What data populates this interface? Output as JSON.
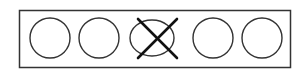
{
  "diagram": {
    "frame": {
      "x": 19,
      "y": 10,
      "width": 272,
      "height": 58,
      "stroke": "#333333"
    },
    "shapes": [
      {
        "type": "circle",
        "cx": 50,
        "cy": 38,
        "rx": 20,
        "ry": 20,
        "crossed": false
      },
      {
        "type": "circle",
        "cx": 99,
        "cy": 38,
        "rx": 20,
        "ry": 20,
        "crossed": false
      },
      {
        "type": "ellipse",
        "cx": 152,
        "cy": 38,
        "rx": 22,
        "ry": 18,
        "crossed": true
      },
      {
        "type": "circle",
        "cx": 213,
        "cy": 38,
        "rx": 20,
        "ry": 20,
        "crossed": false
      },
      {
        "type": "circle",
        "cx": 262,
        "cy": 38,
        "rx": 20,
        "ry": 20,
        "crossed": false
      }
    ],
    "cross": {
      "x1": 138,
      "y1": 19,
      "x2": 177,
      "y2": 58,
      "x3": 177,
      "y3": 19,
      "x4": 138,
      "y4": 58,
      "stroke": "#111111"
    }
  }
}
